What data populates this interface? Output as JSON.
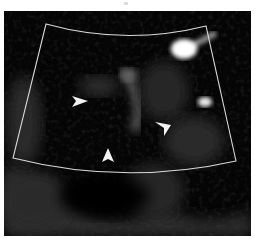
{
  "figure": {
    "type": "ultrasound-image",
    "background_color": "#050505",
    "outline_color": "#d9d9d9",
    "arrowhead_color": "#f2f2f2",
    "sector": {
      "top_left": [
        42,
        13
      ],
      "top_right": [
        202,
        15
      ],
      "bottom_right": [
        232,
        150
      ],
      "bottom_left": [
        9,
        147
      ],
      "top_arc_depth": 24,
      "bottom_arc_depth": 162
    },
    "arrowheads": [
      {
        "id": "left",
        "x": 76,
        "y": 90,
        "direction": "right"
      },
      {
        "id": "right",
        "x": 162,
        "y": 114,
        "direction": "down-left"
      },
      {
        "id": "bottom",
        "x": 104,
        "y": 145,
        "direction": "up"
      }
    ],
    "bright_spots": [
      {
        "id": "upper-right",
        "cx": 180,
        "cy": 38,
        "rx": 13,
        "ry": 10
      },
      {
        "id": "right-middle",
        "cx": 201,
        "cy": 91,
        "rx": 7,
        "ry": 5
      }
    ]
  }
}
